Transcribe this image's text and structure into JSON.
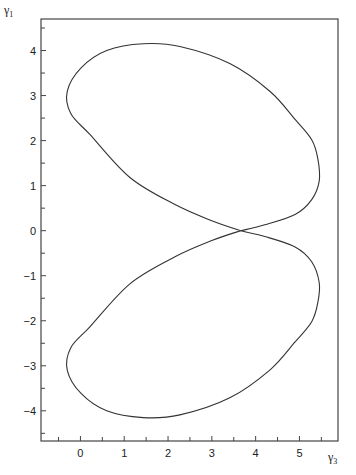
{
  "chart_data": {
    "type": "line",
    "title": "",
    "xlabel": "γ3",
    "ylabel": "γ1",
    "xlabel_main": "γ",
    "xlabel_sub": "3",
    "ylabel_main": "γ",
    "ylabel_sub": "1",
    "xlim": [
      -0.9,
      5.88
    ],
    "ylim": [
      -4.67,
      4.7
    ],
    "grid": false,
    "legend": null,
    "x_ticks": [
      0,
      1,
      2,
      3,
      4,
      5
    ],
    "x_minor_ticks": [
      -0.5,
      0.5,
      1.5,
      2.5,
      3.5,
      4.5,
      5.5
    ],
    "y_ticks": [
      -4,
      -3,
      -2,
      -1,
      0,
      1,
      2,
      3,
      4
    ],
    "y_minor_ticks": [
      -4.5,
      -3.5,
      -2.5,
      -1.5,
      -0.5,
      0.5,
      1.5,
      2.5,
      3.5,
      4.5
    ],
    "series": [
      {
        "name": "closed figure-eight trajectory",
        "points": [
          [
            3.66,
            0.0
          ],
          [
            4.21,
            0.13
          ],
          [
            4.9,
            0.36
          ],
          [
            5.28,
            0.69
          ],
          [
            5.45,
            1.1
          ],
          [
            5.42,
            1.6
          ],
          [
            5.28,
            2.02
          ],
          [
            4.9,
            2.47
          ],
          [
            4.33,
            3.09
          ],
          [
            3.41,
            3.71
          ],
          [
            2.27,
            4.09
          ],
          [
            1.43,
            4.15
          ],
          [
            0.6,
            4.0
          ],
          [
            0.02,
            3.62
          ],
          [
            -0.3,
            3.1
          ],
          [
            -0.22,
            2.6
          ],
          [
            0.22,
            2.13
          ],
          [
            1.13,
            1.18
          ],
          [
            2.16,
            0.58
          ],
          [
            3.0,
            0.22
          ],
          [
            3.66,
            0.0
          ],
          [
            4.21,
            -0.13
          ],
          [
            4.9,
            -0.36
          ],
          [
            5.28,
            -0.69
          ],
          [
            5.45,
            -1.15
          ],
          [
            5.42,
            -1.6
          ],
          [
            5.28,
            -2.02
          ],
          [
            4.9,
            -2.47
          ],
          [
            4.33,
            -3.09
          ],
          [
            3.41,
            -3.71
          ],
          [
            2.27,
            -4.09
          ],
          [
            1.43,
            -4.15
          ],
          [
            0.6,
            -4.0
          ],
          [
            0.02,
            -3.62
          ],
          [
            -0.3,
            -3.1
          ],
          [
            -0.22,
            -2.6
          ],
          [
            0.22,
            -2.13
          ],
          [
            1.13,
            -1.18
          ],
          [
            2.16,
            -0.58
          ],
          [
            3.0,
            -0.22
          ],
          [
            3.66,
            0.0
          ]
        ]
      }
    ],
    "annotations": [
      {
        "text": "crossing point",
        "x": 3.66,
        "y": 0.0
      }
    ]
  }
}
